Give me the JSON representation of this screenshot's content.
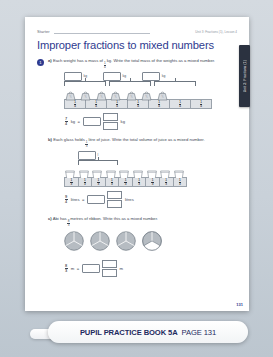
{
  "meta": {
    "starter_label": "Starter",
    "unit_lesson": "Unit 3: Fractions (1), Lesson 4",
    "side_tab": "Unit 3: Fractions (1)",
    "page_number": "131"
  },
  "title": "Improper fractions to mixed numbers",
  "question": {
    "number": "1",
    "parts": [
      {
        "letter": "a)",
        "text_before": "Each weight has a mass of",
        "fraction": {
          "num": "1",
          "den": "4"
        },
        "text_after": "kg. Write the total mass of the weights as a mixed number.",
        "unit": "kg",
        "group_boxes": 3,
        "weights_count": 7,
        "strip_cells": 7,
        "strip_cell_fraction": {
          "num": "1",
          "den": "4"
        },
        "answer_fraction": {
          "num": "7",
          "den": "4"
        },
        "answer_unit": "kg",
        "equals": "="
      },
      {
        "letter": "b)",
        "text_before": "Each glass holds",
        "fraction": {
          "num": "1",
          "den": "3"
        },
        "text_after": "litre of juice. Write the total volume of juice as a mixed number.",
        "unit": "l",
        "group_boxes": 1,
        "glasses_count": 9,
        "strip_cells": 9,
        "strip_cell_fraction": {
          "num": "1",
          "den": "3"
        },
        "answer_fraction": {
          "num": "9",
          "den": "4"
        },
        "answer_unit": "litres",
        "equals": "="
      },
      {
        "letter": "c)",
        "text_before": "Abi has",
        "fraction": {
          "num": "8",
          "den": "3"
        },
        "text_after": "metres of ribbon. Write this as a mixed number.",
        "circles_count": 4,
        "circles_full": 3,
        "circles_partial_thirds": 2,
        "answer_fraction": {
          "num": "8",
          "den": "3"
        },
        "answer_unit": "m",
        "equals": "="
      }
    ]
  },
  "banner": {
    "book": "PUPIL PRACTICE BOOK 5A",
    "page": "PAGE 131"
  }
}
